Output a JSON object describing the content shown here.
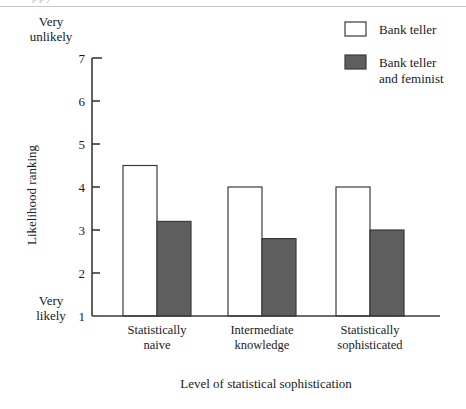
{
  "figure": {
    "cut_off_caption": "p   p                                                y",
    "background": "#ffffff",
    "rule_color": "#c9c9c9"
  },
  "chart_data": {
    "type": "bar",
    "title": "",
    "subtitle": "",
    "xlabel": "Level of statistical sophistication",
    "ylabel": "Likelihood ranking",
    "categories": [
      "Statistically naive",
      "Intermediate knowledge",
      "Statistically sophisticated"
    ],
    "category_lines": [
      [
        "Statistically",
        "naive"
      ],
      [
        "Intermediate",
        "knowledge"
      ],
      [
        "Statistically",
        "sophisticated"
      ]
    ],
    "series": [
      {
        "name": "Bank teller",
        "values": [
          4.5,
          4.0,
          4.0
        ],
        "fill": "#ffffff",
        "stroke": "#3a3a3a"
      },
      {
        "name": "Bank teller and feminist",
        "name_lines": [
          "Bank teller",
          "and feminist"
        ],
        "values": [
          3.2,
          2.8,
          3.0
        ],
        "fill": "#5e5e5e",
        "stroke": "#3a3a3a"
      }
    ],
    "ylim": [
      1,
      7
    ],
    "yticks": [
      1,
      2,
      3,
      4,
      5,
      6,
      7
    ],
    "ytick_labels": [
      "1",
      "2",
      "3",
      "4",
      "5",
      "6",
      "7"
    ],
    "y_axis_anchors": {
      "high": [
        "Very",
        "unlikely"
      ],
      "low": [
        "Very",
        "likely"
      ],
      "high_at": 7,
      "low_at": 1
    },
    "grid": false,
    "legend_position": "top-right",
    "axis_color": "#3a3a3a"
  },
  "legend": {
    "entries": [
      {
        "label": "Bank teller",
        "lines": [
          "Bank teller"
        ],
        "swatch": "white"
      },
      {
        "label": "Bank teller and feminist",
        "lines": [
          "Bank teller",
          "and feminist"
        ],
        "swatch": "gray"
      }
    ]
  }
}
